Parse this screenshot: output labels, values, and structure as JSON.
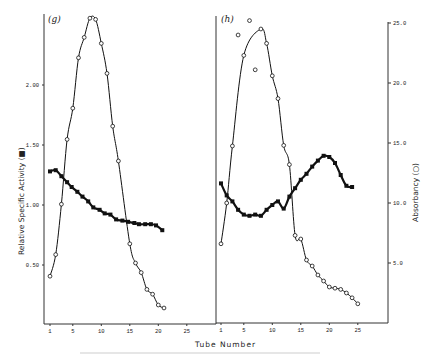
{
  "chart_data": {
    "type": "line",
    "xlabel": "Tube Number",
    "ylabel_left": "Relative Specific Activity (■)",
    "ylabel_right": "Absorbancy (○)",
    "y_left_ticks": [
      "0.50",
      "1.00",
      "1.50",
      "2.00"
    ],
    "y_left_lim": [
      0,
      2.6
    ],
    "y_right_ticks": [
      "5.0",
      "10.0",
      "15.0",
      "20.0",
      "25.0"
    ],
    "y_right_lim": [
      0,
      25.5
    ],
    "x_ticks": [
      "1",
      "5",
      "10",
      "15",
      "20",
      "25"
    ],
    "panels": [
      {
        "label": "(g)",
        "series": [
          {
            "name": "Relative Specific Activity",
            "marker": "filled-square",
            "axis": "left",
            "x": [
              1,
              2,
              3,
              4,
              4.8,
              5.8,
              6.7,
              7.7,
              8.6,
              9.7,
              10.6,
              11.6,
              12.6,
              13.7,
              14.7,
              15.8,
              16.6,
              17.7,
              18.7,
              19.6,
              20.7
            ],
            "y": [
              1.28,
              1.29,
              1.24,
              1.19,
              1.15,
              1.11,
              1.07,
              1.03,
              0.98,
              0.96,
              0.93,
              0.92,
              0.88,
              0.87,
              0.86,
              0.85,
              0.84,
              0.84,
              0.84,
              0.83,
              0.79
            ]
          },
          {
            "name": "Absorbancy",
            "marker": "open-circle",
            "axis": "right",
            "x": [
              1,
              2,
              3,
              4,
              5,
              6,
              7,
              8,
              9,
              10,
              11,
              12,
              13,
              15,
              16,
              17,
              18,
              19,
              20,
              21
            ],
            "y": [
              3.9,
              5.7,
              9.9,
              15.3,
              17.9,
              22.1,
              23.8,
              25.4,
              25.3,
              23.3,
              20.8,
              16.4,
              13.5,
              6.6,
              5.0,
              4.2,
              2.8,
              2.4,
              1.5,
              1.25
            ]
          }
        ]
      },
      {
        "label": "(h)",
        "series": [
          {
            "name": "Relative Specific Activity",
            "marker": "filled-square",
            "axis": "left",
            "x": [
              1,
              2,
              3,
              4,
              5,
              6,
              7,
              8,
              9,
              10,
              11,
              12,
              13,
              14,
              15,
              16,
              17,
              18,
              19,
              20,
              21,
              22,
              23,
              24
            ],
            "y": [
              1.18,
              1.08,
              1.03,
              0.96,
              0.92,
              0.91,
              0.92,
              0.91,
              0.96,
              1.0,
              1.03,
              0.97,
              1.07,
              1.14,
              1.21,
              1.26,
              1.32,
              1.37,
              1.41,
              1.4,
              1.35,
              1.25,
              1.16,
              1.15
            ]
          },
          {
            "name": "Absorbancy",
            "marker": "open-circle",
            "axis": "right",
            "x": [
              1,
              2,
              3,
              4,
              5,
              6,
              7,
              8,
              9,
              10,
              11,
              12,
              13,
              14,
              15,
              16,
              17,
              18,
              19,
              20,
              21,
              22,
              23,
              24,
              25
            ],
            "y": [
              6.6,
              10.0,
              14.75,
              24.0,
              22.3,
              25.2,
              21.1,
              24.5,
              23.3,
              20.6,
              18.7,
              14.8,
              13.2,
              7.3,
              7.0,
              5.25,
              4.75,
              4.0,
              3.5,
              3.0,
              2.9,
              2.8,
              2.5,
              2.1,
              1.6
            ]
          }
        ]
      }
    ],
    "grid": false,
    "legend": "none (markers described in axis labels)"
  },
  "labels": {
    "panel_g": "(g)",
    "panel_h": "(h)",
    "xlabel": "Tube Number",
    "ylabel_left": "Relative Specific Activity (■)",
    "ylabel_right": "Absorbancy (○)"
  }
}
